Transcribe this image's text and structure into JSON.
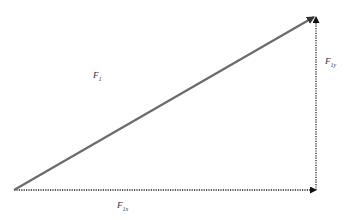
{
  "diagram": {
    "colors": {
      "resultant": "#6b6b6b",
      "components": "#222222",
      "text": "#333333"
    },
    "vectors": [
      {
        "id": "F1",
        "label": "F",
        "subscript": "1",
        "x1": 14,
        "y1": 190,
        "x2": 316,
        "y2": 16,
        "style": "solid"
      },
      {
        "id": "F1x",
        "label": "F",
        "subscript": "1x",
        "x1": 14,
        "y1": 190,
        "x2": 316,
        "y2": 190,
        "style": "dotted"
      },
      {
        "id": "F1y",
        "label": "F",
        "subscript": "1y",
        "x1": 316,
        "y1": 190,
        "x2": 316,
        "y2": 16,
        "style": "dotted"
      }
    ],
    "labels": {
      "f1": {
        "main": "F",
        "sub": "1"
      },
      "f1y": {
        "main": "F",
        "sub": "1y"
      },
      "f1x": {
        "main": "F",
        "sub": "1x"
      }
    }
  }
}
